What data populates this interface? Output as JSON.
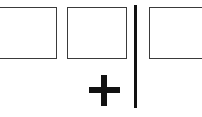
{
  "diagram": {
    "boxes": [
      {
        "id": "box-1",
        "label": ""
      },
      {
        "id": "box-2",
        "label": ""
      },
      {
        "id": "box-3",
        "label": ""
      }
    ],
    "operator_symbol": "plus",
    "colors": {
      "box_border": "#3a3a3a",
      "divider": "#111111",
      "plus": "#111111",
      "background": "#ffffff"
    }
  }
}
